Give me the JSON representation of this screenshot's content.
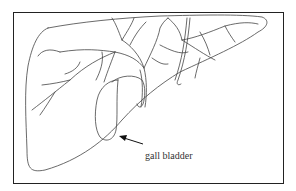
{
  "diagram": {
    "labels": [
      {
        "text": "gall bladder",
        "target": "gall-bladder"
      }
    ],
    "colors": {
      "line": "#444444",
      "background": "#ffffff",
      "frame": "#222222"
    }
  }
}
